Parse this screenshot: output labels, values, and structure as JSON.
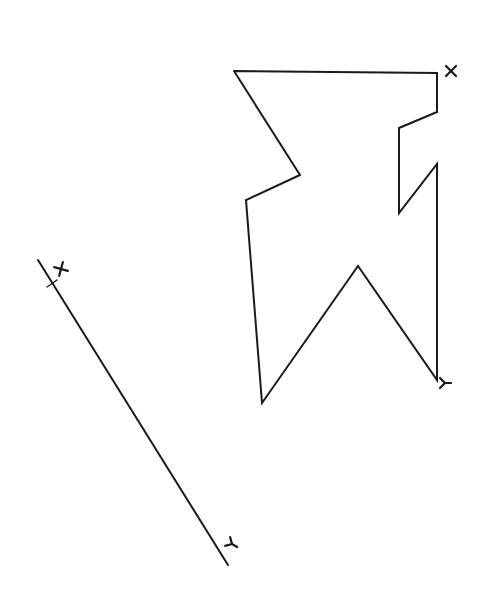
{
  "figure": {
    "background": "#ffffff",
    "stroke_color": "#1a1a1a",
    "polygon": {
      "name": "irregular-closed-contour",
      "points": [
        [
          234,
          71
        ],
        [
          437,
          73
        ],
        [
          437,
          112
        ],
        [
          399,
          128
        ],
        [
          399,
          213
        ],
        [
          437,
          164
        ],
        [
          437,
          380
        ],
        [
          358,
          266
        ],
        [
          262,
          403
        ],
        [
          246,
          200
        ],
        [
          300,
          175
        ],
        [
          234,
          71
        ]
      ],
      "start_label": {
        "text": "X",
        "x": 451,
        "y": 71
      },
      "end_label": {
        "text": "Y",
        "x": 443,
        "y": 383
      }
    },
    "segment": {
      "name": "straight-reference-line",
      "from": [
        38,
        260
      ],
      "to": [
        228,
        565
      ],
      "tick_at": [
        52,
        283
      ],
      "start_label": {
        "text": "X",
        "x": 61,
        "y": 270
      },
      "end_label": {
        "text": "Y",
        "x": 232,
        "y": 544
      }
    }
  }
}
